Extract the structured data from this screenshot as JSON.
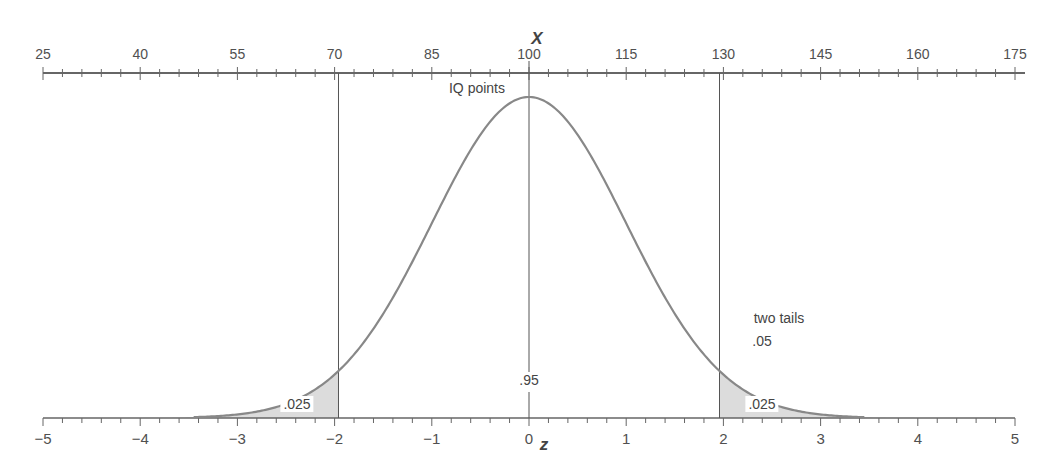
{
  "chart_data": {
    "type": "area",
    "title": "",
    "top_axis": {
      "label": "X",
      "sublabel": "IQ points",
      "ticks": [
        25,
        40,
        55,
        70,
        85,
        100,
        115,
        130,
        145,
        160,
        175
      ],
      "range": [
        25,
        175
      ],
      "minor_tick_step": 3
    },
    "bottom_axis": {
      "label": "z",
      "ticks": [
        "−5",
        "−4",
        "−3",
        "−2",
        "−1",
        "0",
        "1",
        "2",
        "3",
        "4",
        "5"
      ],
      "range": [
        -5,
        5
      ],
      "minor_tick_step": 0.2
    },
    "distribution": {
      "mean_z": 0,
      "sd_z": 1,
      "mean_x": 100,
      "sd_x": 15
    },
    "critical_lines_z": [
      -1.96,
      1.96
    ],
    "shaded_regions": [
      {
        "name": "left tail",
        "from_z": -5,
        "to_z": -1.96,
        "area_label": ".025"
      },
      {
        "name": "right tail",
        "from_z": 1.96,
        "to_z": 5,
        "area_label": ".025"
      }
    ],
    "annotations": {
      "center_area": ".95",
      "two_tails_title": "two tails",
      "two_tails_value": ".05",
      "left_tail": ".025",
      "right_tail": ".025"
    },
    "colors": {
      "curve": "#888888",
      "axis": "#666666",
      "shade": "#dcdcdc",
      "lines": "#555555"
    }
  }
}
